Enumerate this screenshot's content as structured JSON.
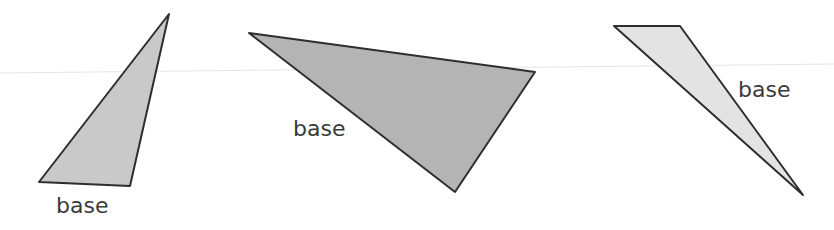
{
  "figure": {
    "background": "#ffffff",
    "stroke_color": "#2e2e2e",
    "guide_line_color": "#e2e2e2"
  },
  "triangles": [
    {
      "label": "base",
      "fill": "#c9c9c9",
      "points": "169,14 39,182 130,186"
    },
    {
      "label": "base",
      "fill": "#b4b4b4",
      "points": "249,33 535,72 455,192"
    },
    {
      "label": "base",
      "fill": "#e3e3e3",
      "points": "614,26 680,26 803,195"
    }
  ]
}
